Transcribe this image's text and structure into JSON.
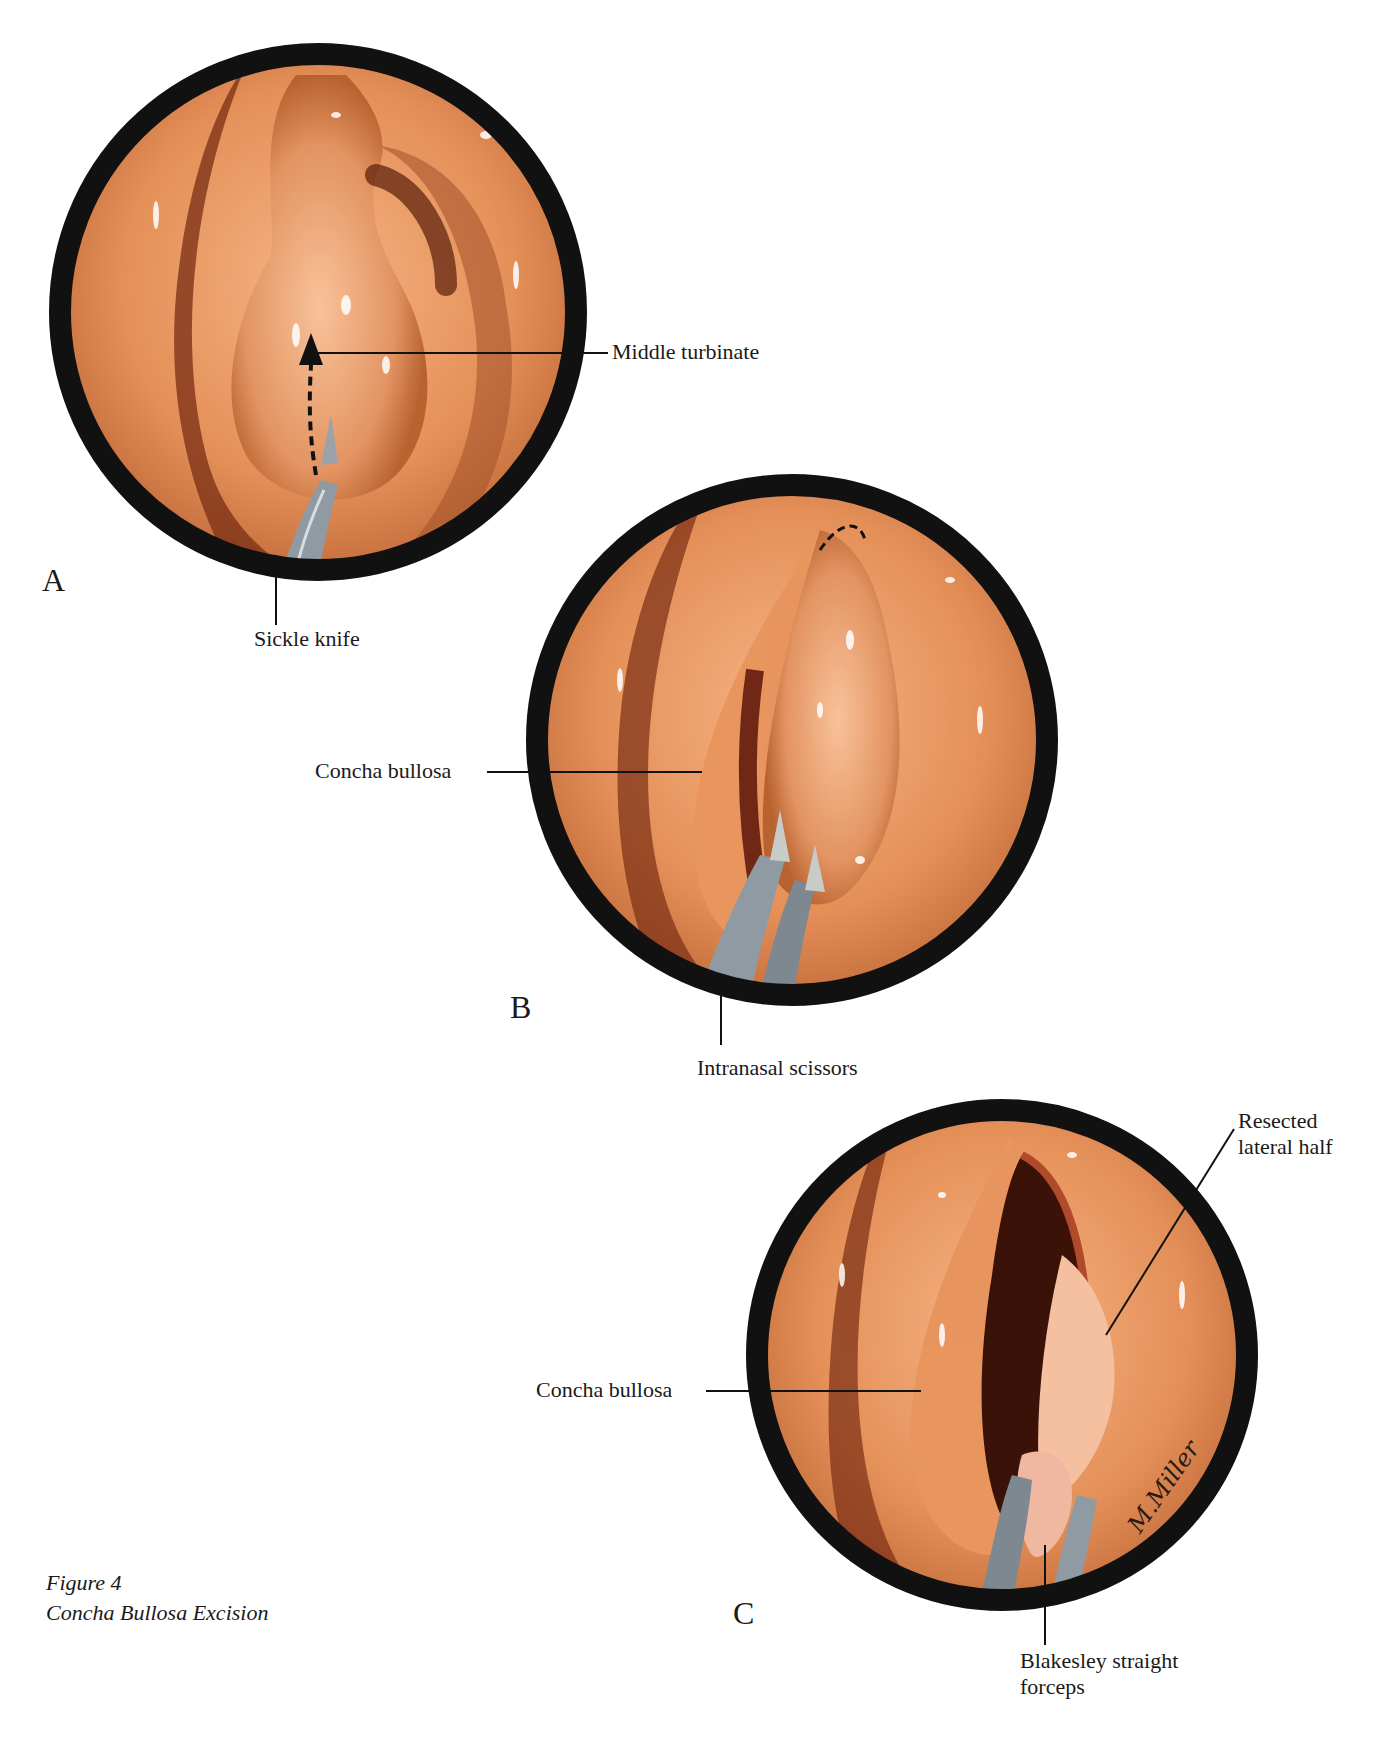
{
  "figure": {
    "number_label": "Figure 4",
    "title": "Concha Bullosa Excision"
  },
  "colors": {
    "ring": "#111111",
    "mucosa_light": "#f2a474",
    "mucosa_mid": "#dc8550",
    "mucosa_dark": "#9a4a26",
    "cavity": "#3a1208",
    "instrument": "#8f9aa3",
    "highlight": "#ffffff"
  },
  "panels": [
    {
      "letter": "A",
      "labels": [
        {
          "text": "Middle turbinate"
        },
        {
          "text": "Sickle knife"
        }
      ]
    },
    {
      "letter": "B",
      "labels": [
        {
          "text": "Concha bullosa"
        },
        {
          "text": "Intranasal scissors"
        }
      ]
    },
    {
      "letter": "C",
      "labels": [
        {
          "text": "Resected"
        },
        {
          "text": "lateral half"
        },
        {
          "text": "Concha bullosa"
        },
        {
          "text": "Blakesley straight"
        },
        {
          "text": "forceps"
        }
      ]
    }
  ],
  "signature": "M.Miller"
}
